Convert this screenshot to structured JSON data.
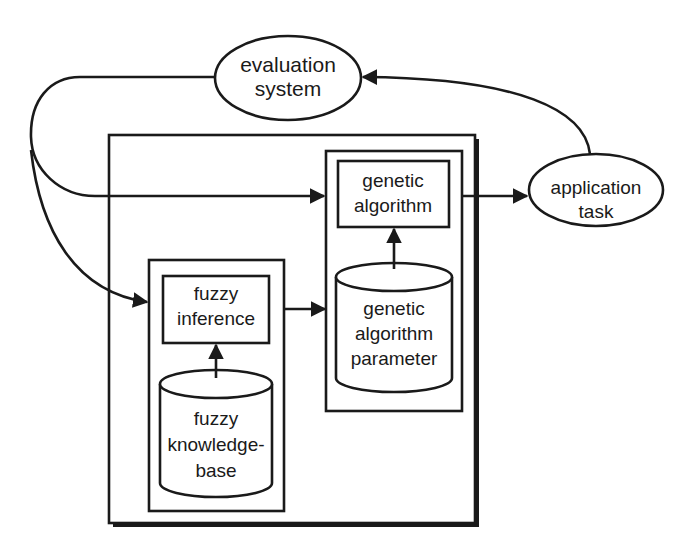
{
  "diagram": {
    "type": "block-diagram",
    "nodes": {
      "evaluation": {
        "lines": [
          "evaluation",
          "system"
        ],
        "shape": "ellipse"
      },
      "application": {
        "lines": [
          "application",
          "task"
        ],
        "shape": "ellipse"
      },
      "genetic_algorithm": {
        "lines": [
          "genetic",
          "algorithm"
        ],
        "shape": "rectangle"
      },
      "ga_parameter": {
        "lines": [
          "genetic",
          "algorithm",
          "parameter"
        ],
        "shape": "cylinder"
      },
      "fuzzy_inference": {
        "lines": [
          "fuzzy",
          "inference"
        ],
        "shape": "rectangle"
      },
      "fuzzy_kb": {
        "lines": [
          "fuzzy",
          "knowledge-",
          "base"
        ],
        "shape": "cylinder"
      }
    },
    "edges": [
      {
        "from": "evaluation",
        "to": "genetic_algorithm"
      },
      {
        "from": "evaluation",
        "to": "fuzzy_inference"
      },
      {
        "from": "fuzzy_inference",
        "to": "ga_parameter"
      },
      {
        "from": "ga_parameter",
        "to": "genetic_algorithm"
      },
      {
        "from": "fuzzy_kb",
        "to": "fuzzy_inference"
      },
      {
        "from": "genetic_algorithm",
        "to": "application"
      },
      {
        "from": "application",
        "to": "evaluation"
      }
    ],
    "colors": {
      "line": "#1a1a1a",
      "background": "#ffffff"
    }
  }
}
